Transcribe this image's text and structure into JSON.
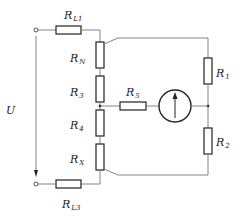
{
  "diagram": {
    "type": "circuit-schematic",
    "voltage_label": "U",
    "components": [
      {
        "id": "RL1",
        "label": "R",
        "sub": "L1",
        "kind": "resistor",
        "orientation": "horizontal"
      },
      {
        "id": "RN",
        "label": "R",
        "sub": "N",
        "kind": "resistor",
        "orientation": "vertical"
      },
      {
        "id": "R3",
        "label": "R",
        "sub": "3",
        "kind": "resistor",
        "orientation": "vertical"
      },
      {
        "id": "R4",
        "label": "R",
        "sub": "4",
        "kind": "resistor",
        "orientation": "vertical"
      },
      {
        "id": "RX",
        "label": "R",
        "sub": "X",
        "kind": "resistor",
        "orientation": "vertical"
      },
      {
        "id": "RL3",
        "label": "R",
        "sub": "L3",
        "kind": "resistor",
        "orientation": "horizontal"
      },
      {
        "id": "R5",
        "label": "R",
        "sub": "5",
        "kind": "resistor",
        "orientation": "horizontal"
      },
      {
        "id": "R1",
        "label": "R",
        "sub": "1",
        "kind": "resistor",
        "orientation": "vertical"
      },
      {
        "id": "R2",
        "label": "R",
        "sub": "2",
        "kind": "resistor",
        "orientation": "vertical"
      },
      {
        "id": "G",
        "label": "",
        "kind": "galvanometer",
        "symbol": "circle-with-up-arrow"
      }
    ],
    "terminals": [
      "top-input",
      "bottom-input"
    ],
    "colors": {
      "wire": "#777777",
      "component": "#222222",
      "background": "#ffffff"
    }
  }
}
